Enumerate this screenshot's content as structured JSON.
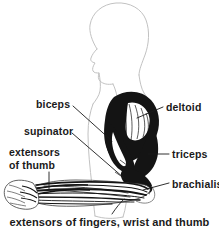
{
  "figure": {
    "background_color": "#ffffff",
    "ink_color": "#1a1a1a",
    "outline_color": "#c8c8c8"
  },
  "labels": {
    "biceps": "biceps",
    "supinator": "supinator",
    "extensors_of_thumb": "extensors of thumb",
    "deltoid": "deltoid",
    "triceps": "triceps",
    "brachialis": "brachialis"
  },
  "caption": "extensors of fingers, wrist and thumb",
  "anatomy": {
    "body_outline": "head-neck-torso-profile",
    "limb": "right-arm-flexed",
    "hand": "clenched-fist"
  }
}
